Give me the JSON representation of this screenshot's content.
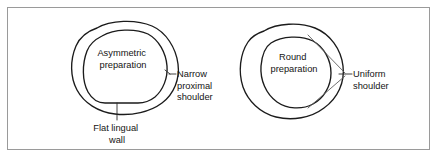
{
  "figure": {
    "background_color": "#ffffff",
    "frame_color": "#9a9a9a",
    "outline_color": "#1b1b1b",
    "leader_color": "#5f5f5f",
    "text_color": "#141414"
  },
  "left_diagram": {
    "name": "asymmetric-preparation",
    "inner_label": {
      "line1": "Asymmetric",
      "line2": "preparation"
    },
    "callouts": [
      {
        "name": "narrow-proximal-shoulder",
        "line1": "Narrow",
        "line2": "proximal",
        "line3": "shoulder"
      },
      {
        "name": "flat-lingual-wall",
        "line1": "Flat lingual",
        "line2": "wall"
      }
    ]
  },
  "right_diagram": {
    "name": "round-preparation",
    "inner_label": {
      "line1": "Round",
      "line2": "preparation"
    },
    "callouts": [
      {
        "name": "uniform-shoulder",
        "line1": "Uniform",
        "line2": "shoulder"
      }
    ]
  }
}
